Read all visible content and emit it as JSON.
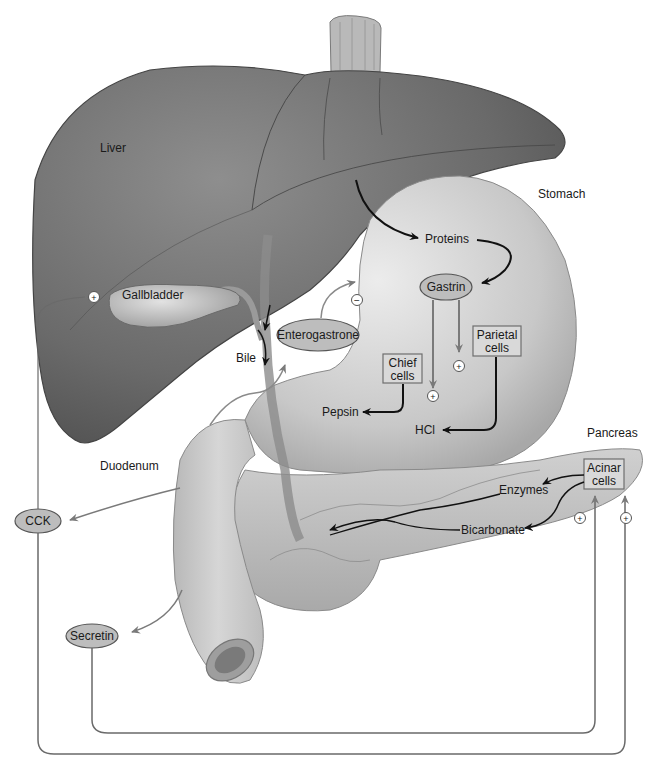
{
  "diagram": {
    "organs": {
      "liver": "Liver",
      "stomach": "Stomach",
      "gallbladder": "Gallbladder",
      "duodenum": "Duodenum",
      "pancreas": "Pancreas",
      "bile": "Bile"
    },
    "hormones": {
      "enterogastrone": "Enterogastrone",
      "gastrin": "Gastrin",
      "cck": "CCK",
      "secretin": "Secretin"
    },
    "cells": {
      "chief_l1": "Chief",
      "chief_l2": "cells",
      "parietal_l1": "Parietal",
      "parietal_l2": "cells",
      "acinar_l1": "Acinar",
      "acinar_l2": "cells"
    },
    "products": {
      "proteins": "Proteins",
      "pepsin": "Pepsin",
      "hcl": "HCl",
      "enzymes": "Enzymes",
      "bicarbonate": "Bicarbonate"
    },
    "signs": {
      "plus": "+",
      "minus": "−"
    },
    "colors": {
      "liver": "#6b6b6b",
      "liver_light": "#8a8a8a",
      "stomach": "#c9c9c9",
      "pancreas": "#bdbdbd",
      "hormone_fill": "#bdbdbd",
      "box_fill": "#d9d9d9",
      "arrow_black": "#111111",
      "arrow_gray": "#7a7a7a"
    }
  }
}
